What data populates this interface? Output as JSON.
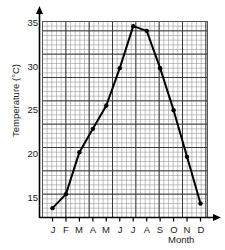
{
  "chart_data": {
    "type": "line",
    "title": "",
    "xlabel": "Month",
    "ylabel": "Temperature (°C)",
    "categories": [
      "J",
      "F",
      "M",
      "A",
      "M",
      "J",
      "J",
      "A",
      "S",
      "O",
      "N",
      "D"
    ],
    "month_names": [
      "January",
      "February",
      "March",
      "April",
      "May",
      "June",
      "July",
      "August",
      "September",
      "October",
      "November",
      "December"
    ],
    "values": [
      16,
      17.5,
      22,
      24.5,
      27,
      31,
      35.5,
      35,
      31,
      26.5,
      21.5,
      16.5
    ],
    "ylim": [
      15,
      36
    ],
    "yticks": [
      15,
      20,
      25,
      30,
      35
    ],
    "ytick_labels": [
      "15",
      "20",
      "25",
      "30",
      "35"
    ],
    "grid": true,
    "grid_minor_step": 0.5,
    "grid_major_step": 2.5,
    "legend": "none",
    "marker": "filled-circle",
    "line_color": "#000000",
    "grid_color": "#9a9a9a",
    "grid_major_color": "#3a3a3a",
    "axis_color": "#000000",
    "background_color": "#ffffff"
  },
  "axes": {
    "y_title": "Temperature (°C)",
    "x_title": "Month"
  },
  "ticks": {
    "y": [
      {
        "label": "35",
        "top": 17
      },
      {
        "label": "30",
        "top": 61
      },
      {
        "label": "25",
        "top": 104
      },
      {
        "label": "20",
        "top": 148
      },
      {
        "label": "15",
        "top": 192
      }
    ],
    "x": [
      {
        "label": "J",
        "left": 46
      },
      {
        "label": "F",
        "left": 59
      },
      {
        "label": "M",
        "left": 72
      },
      {
        "label": "A",
        "left": 86
      },
      {
        "label": "M",
        "left": 99
      },
      {
        "label": "J",
        "left": 113
      },
      {
        "label": "J",
        "left": 126
      },
      {
        "label": "A",
        "left": 140
      },
      {
        "label": "S",
        "left": 153
      },
      {
        "label": "O",
        "left": 167
      },
      {
        "label": "N",
        "left": 180
      },
      {
        "label": "D",
        "left": 194
      }
    ]
  }
}
